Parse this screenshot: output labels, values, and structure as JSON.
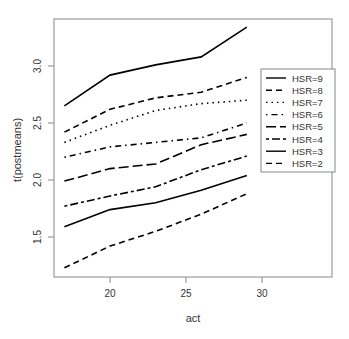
{
  "chart_data": {
    "type": "line",
    "title": "",
    "xlabel": "act",
    "ylabel": "t(postmeans)",
    "x": [
      17,
      20,
      23,
      26,
      29
    ],
    "xlim": [
      16.4,
      34.6
    ],
    "ylim": [
      1.12,
      3.38
    ],
    "xticks": [
      20,
      25,
      30
    ],
    "yticks": [
      1.5,
      2.0,
      2.5,
      3.0
    ],
    "xtick_labels": [
      "20",
      "25",
      "30"
    ],
    "ytick_labels": [
      "1.5",
      "2.0",
      "2.5",
      "3.0"
    ],
    "grid": false,
    "legend_position": "right-inside",
    "series": [
      {
        "name": "HSR=9",
        "dash": "solid",
        "values": [
          2.65,
          2.92,
          3.01,
          3.08,
          3.34
        ]
      },
      {
        "name": "HSR=8",
        "dash": "dashed",
        "values": [
          2.42,
          2.62,
          2.72,
          2.77,
          2.9
        ]
      },
      {
        "name": "HSR=7",
        "dash": "dotted",
        "values": [
          2.33,
          2.48,
          2.61,
          2.67,
          2.7
        ]
      },
      {
        "name": "HSR=6",
        "dash": "dotdash",
        "values": [
          2.2,
          2.29,
          2.33,
          2.37,
          2.5
        ]
      },
      {
        "name": "HSR=5",
        "dash": "longdash",
        "values": [
          1.99,
          2.1,
          2.14,
          2.31,
          2.4
        ]
      },
      {
        "name": "HSR=4",
        "dash": "twodash",
        "values": [
          1.77,
          1.86,
          1.94,
          2.09,
          2.21
        ]
      },
      {
        "name": "HSR=3",
        "dash": "solid",
        "values": [
          1.59,
          1.74,
          1.8,
          1.91,
          2.04
        ]
      },
      {
        "name": "HSR=2",
        "dash": "dashed",
        "values": [
          1.23,
          1.42,
          1.55,
          1.7,
          1.88
        ]
      }
    ],
    "line_color": "#000000",
    "axis_color": "#888888"
  }
}
